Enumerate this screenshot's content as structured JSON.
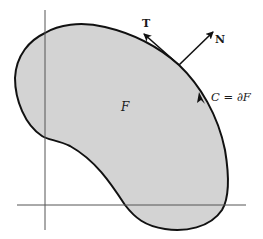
{
  "figure": {
    "type": "region-boundary-diagram",
    "colors": {
      "region_fill": "#d3d3d3",
      "boundary": "#111111",
      "axes": "#555555",
      "background": "#ffffff"
    },
    "labels": {
      "region": "F",
      "tangent": "T",
      "normal": "N",
      "boundary": "C = ∂F"
    },
    "axes": {
      "horizontal": {
        "x1": 17,
        "x2": 246,
        "y": 205
      },
      "vertical": {
        "x": 45,
        "y1": 10,
        "y2": 230
      }
    },
    "tangent_point": {
      "x": 179,
      "y": 65
    }
  }
}
